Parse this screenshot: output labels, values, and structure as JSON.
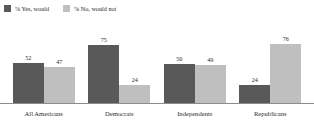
{
  "chart_data": {
    "type": "bar",
    "title": "",
    "subtitle": "",
    "xlabel": "",
    "ylabel": "",
    "ylim": [
      0,
      100
    ],
    "grid": false,
    "legend_position": "top-left",
    "categories": [
      "All Americans",
      "Democrats",
      "Independents",
      "Republicans"
    ],
    "series": [
      {
        "name": "% Yes, would",
        "color": "#595959",
        "values": [
          52,
          75,
          50,
          24
        ]
      },
      {
        "name": "% No, would not",
        "color": "#bfbfbf",
        "values": [
          47,
          24,
          49,
          76
        ]
      }
    ]
  },
  "legend": {
    "entries": [
      {
        "label": "% Yes, would",
        "color": "#595959"
      },
      {
        "label": "% No, would not",
        "color": "#bfbfbf"
      }
    ]
  },
  "axis": {
    "line_color": "#8c8c8c"
  }
}
